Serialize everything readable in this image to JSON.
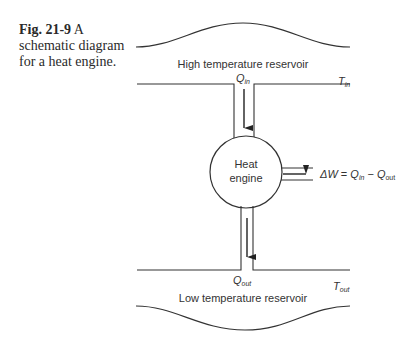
{
  "caption": {
    "figure_number": "Fig. 21-9",
    "text": "A schematic diagram for a heat engine."
  },
  "diagram": {
    "high_reservoir_label": "High temperature reservoir",
    "low_reservoir_label": "Low temperature reservoir",
    "t_in": {
      "symbol": "T",
      "subscript": "in"
    },
    "t_out": {
      "symbol": "T",
      "subscript": "out"
    },
    "q_in": {
      "symbol": "Q",
      "subscript": "in"
    },
    "q_out": {
      "symbol": "Q",
      "subscript": "out"
    },
    "engine_label_line1": "Heat",
    "engine_label_line2": "engine",
    "work_equation": {
      "lhs": "ΔW",
      "eq": " = ",
      "q1": "Q",
      "q1_sub": "in",
      "minus": " − ",
      "q2": "Q",
      "q2_sub": "out"
    }
  }
}
